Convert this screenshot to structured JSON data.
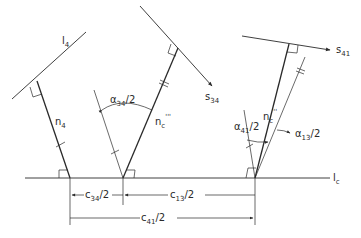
{
  "figure": {
    "type": "geometry-diagram",
    "labels": {
      "l4": {
        "main": "l",
        "sub": "4"
      },
      "n4": {
        "main": "n",
        "sub": "4"
      },
      "s34": {
        "main": "s",
        "sub": "34"
      },
      "s41": {
        "main": "s",
        "sub": "41"
      },
      "nc3": {
        "main": "n",
        "sub": "c",
        "sup": "'''"
      },
      "nc2": {
        "main": "n",
        "sub": "c",
        "sup": "''"
      },
      "alpha34": {
        "main": "α",
        "sub": "34",
        "suffix": "/2"
      },
      "alpha41": {
        "main": "α",
        "sub": "41",
        "suffix": "/2"
      },
      "alpha13": {
        "main": "α",
        "sub": "13",
        "suffix": "/2"
      },
      "lc": {
        "main": "l",
        "sub": "c"
      },
      "c34": {
        "main": "c",
        "sub": "34",
        "suffix": "/2"
      },
      "c13": {
        "main": "c",
        "sub": "13",
        "suffix": "/2"
      },
      "c41": {
        "main": "c",
        "sub": "41",
        "suffix": "/2"
      }
    },
    "color": "#2a2a2a"
  }
}
